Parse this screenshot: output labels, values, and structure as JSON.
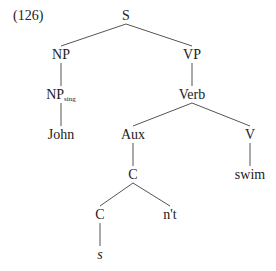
{
  "example_number": "(126)",
  "tree": {
    "nodes": [
      {
        "id": "S",
        "label": "S"
      },
      {
        "id": "NP",
        "label": "NP"
      },
      {
        "id": "VP",
        "label": "VP"
      },
      {
        "id": "NPsing",
        "label": "NP",
        "subscript": "sing"
      },
      {
        "id": "Verb",
        "label": "Verb"
      },
      {
        "id": "John",
        "label": "John"
      },
      {
        "id": "Aux",
        "label": "Aux"
      },
      {
        "id": "V",
        "label": "V"
      },
      {
        "id": "C1",
        "label": "C"
      },
      {
        "id": "swim",
        "label": "swim"
      },
      {
        "id": "C2",
        "label": "C"
      },
      {
        "id": "nt",
        "label": "n't"
      },
      {
        "id": "s",
        "label": "s",
        "italic": true
      }
    ],
    "edges": [
      [
        "S",
        "NP"
      ],
      [
        "S",
        "VP"
      ],
      [
        "NP",
        "NPsing"
      ],
      [
        "VP",
        "Verb"
      ],
      [
        "NPsing",
        "John"
      ],
      [
        "Verb",
        "Aux"
      ],
      [
        "Verb",
        "V"
      ],
      [
        "Aux",
        "C1"
      ],
      [
        "V",
        "swim"
      ],
      [
        "C1",
        "C2"
      ],
      [
        "C1",
        "nt"
      ],
      [
        "C2",
        "s"
      ]
    ]
  }
}
